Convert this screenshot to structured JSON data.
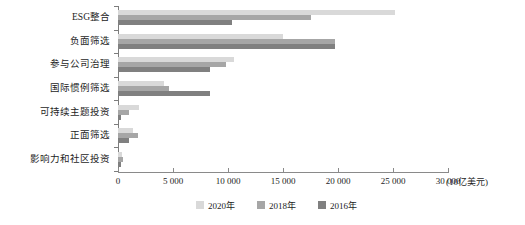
{
  "chart_data": {
    "type": "bar",
    "orientation": "horizontal",
    "title": "",
    "subtitle": "",
    "xlabel": "(10亿美元)",
    "ylabel": "",
    "xlim": [
      0,
      30000
    ],
    "xticks": [
      0,
      5000,
      10000,
      15000,
      20000,
      25000,
      30000
    ],
    "xtick_labels": [
      "0",
      "5 000",
      "10 000",
      "15 000",
      "20 000",
      "25 000",
      "30 000"
    ],
    "grid": false,
    "legend_position": "bottom",
    "categories": [
      "ESG整合",
      "负面筛选",
      "参与公司治理",
      "国际惯例筛选",
      "可持续主题投资",
      "正面筛选",
      "影响力和社区投资"
    ],
    "series": [
      {
        "name": "2020年",
        "color": "#d9d9d9",
        "values": [
          25195,
          15030,
          10504,
          4140,
          1948,
          1384,
          352
        ]
      },
      {
        "name": "2018年",
        "color": "#a6a6a6",
        "values": [
          17544,
          19771,
          9835,
          4679,
          1018,
          1842,
          444
        ]
      },
      {
        "name": "2016年",
        "color": "#808080",
        "values": [
          10353,
          19772,
          8385,
          8385,
          276,
          1030,
          248
        ]
      }
    ]
  },
  "legend": {
    "items": [
      {
        "label": "2020年",
        "color": "#d9d9d9"
      },
      {
        "label": "2018年",
        "color": "#a6a6a6"
      },
      {
        "label": "2016年",
        "color": "#808080"
      }
    ]
  },
  "axis": {
    "unit_label": "(10亿美元)"
  },
  "colors": {
    "axis": "#8a8a8a",
    "text": "#1d1d1d",
    "background": "#ffffff"
  }
}
